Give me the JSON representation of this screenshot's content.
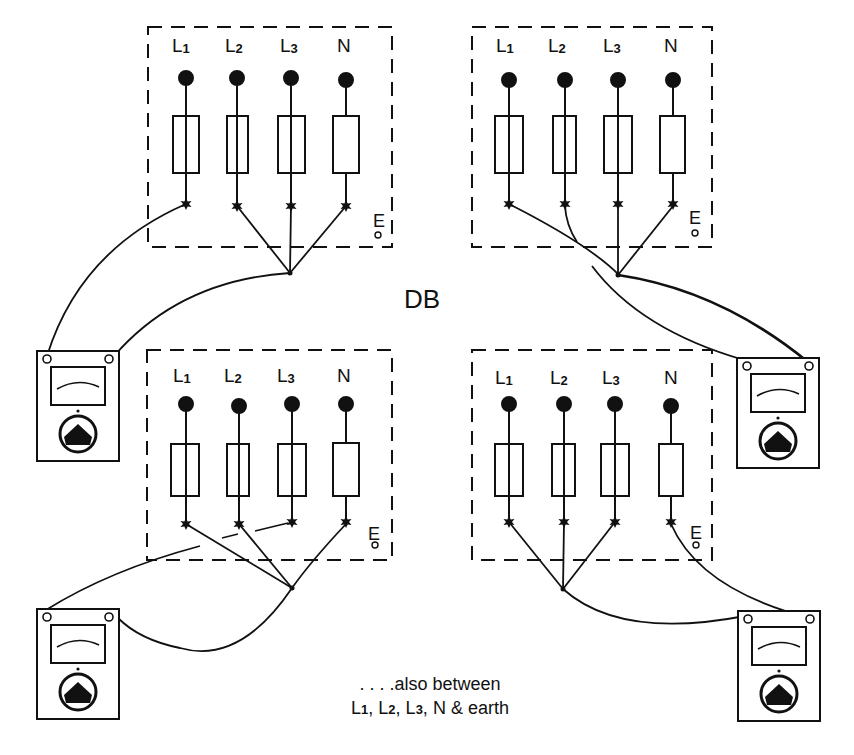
{
  "diagram": {
    "title": "DB",
    "earth_label": "E",
    "panels": [
      {
        "id": "top-left",
        "terminals": [
          {
            "base": "L",
            "sub": "1"
          },
          {
            "base": "L",
            "sub": "2"
          },
          {
            "base": "L",
            "sub": "3"
          },
          {
            "base": "N",
            "sub": ""
          }
        ],
        "test": "L1 to L2+L3+N"
      },
      {
        "id": "top-right",
        "terminals": [
          {
            "base": "L",
            "sub": "1"
          },
          {
            "base": "L",
            "sub": "2"
          },
          {
            "base": "L",
            "sub": "3"
          },
          {
            "base": "N",
            "sub": ""
          }
        ],
        "test": "L2 to L1+L3+N"
      },
      {
        "id": "bottom-left",
        "terminals": [
          {
            "base": "L",
            "sub": "1"
          },
          {
            "base": "L",
            "sub": "2"
          },
          {
            "base": "L",
            "sub": "3"
          },
          {
            "base": "N",
            "sub": ""
          }
        ],
        "test": "L3 to L1+L2+N"
      },
      {
        "id": "bottom-right",
        "terminals": [
          {
            "base": "L",
            "sub": "1"
          },
          {
            "base": "L",
            "sub": "2"
          },
          {
            "base": "L",
            "sub": "3"
          },
          {
            "base": "N",
            "sub": ""
          }
        ],
        "test": "N to L1+L2+L3"
      }
    ],
    "meters": [
      {
        "id": "meter-top-left",
        "icon": "insulation-tester-icon"
      },
      {
        "id": "meter-top-right",
        "icon": "insulation-tester-icon"
      },
      {
        "id": "meter-bottom-left",
        "icon": "insulation-tester-icon"
      },
      {
        "id": "meter-bottom-right",
        "icon": "insulation-tester-icon"
      }
    ],
    "note": {
      "line1": ". . . .also between",
      "line2_parts": [
        {
          "base": "L",
          "sub": "1",
          "sep": ", "
        },
        {
          "base": "L",
          "sub": "2",
          "sep": ", "
        },
        {
          "base": "L",
          "sub": "3",
          "sep": ", "
        },
        {
          "base": "N & earth",
          "sub": "",
          "sep": ""
        }
      ]
    },
    "colors": {
      "ink": "#111111",
      "background": "#ffffff"
    }
  }
}
